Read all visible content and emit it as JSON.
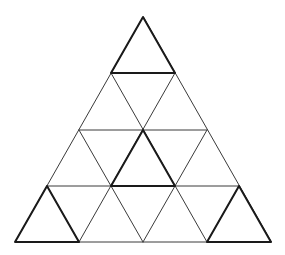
{
  "diagram": {
    "type": "triangle-grid-puzzle",
    "rows": 4,
    "colors": {
      "background": "#ffffff",
      "line": "#3a3a3a",
      "highlight": "#1a1a1a"
    },
    "outer_triangle": {
      "apex": [
        143,
        17
      ],
      "base_left": [
        15,
        242
      ],
      "base_right": [
        271,
        242
      ]
    },
    "highlighted_triangles": [
      {
        "name": "top",
        "points": [
          [
            143,
            17
          ],
          [
            111,
            73
          ],
          [
            175,
            73
          ]
        ]
      },
      {
        "name": "center",
        "points": [
          [
            143,
            130
          ],
          [
            111,
            186
          ],
          [
            175,
            186
          ]
        ]
      },
      {
        "name": "bottom-left",
        "points": [
          [
            47,
            186
          ],
          [
            15,
            242
          ],
          [
            79,
            242
          ]
        ]
      },
      {
        "name": "bottom-right",
        "points": [
          [
            239,
            186
          ],
          [
            207,
            242
          ],
          [
            271,
            242
          ]
        ]
      }
    ]
  }
}
